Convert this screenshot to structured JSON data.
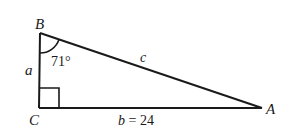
{
  "diagram": {
    "type": "right-triangle",
    "vertices": {
      "A": {
        "label": "A",
        "x": 262,
        "y": 108
      },
      "B": {
        "label": "B",
        "x": 40,
        "y": 33
      },
      "C": {
        "label": "C",
        "x": 39,
        "y": 108
      }
    },
    "sides": {
      "a": {
        "label": "a"
      },
      "b": {
        "label": "b = 24"
      },
      "c": {
        "label": "c"
      }
    },
    "angle_B": {
      "label": "71°"
    },
    "right_angle_at": "C",
    "stroke_color": "#1a1a1a"
  }
}
